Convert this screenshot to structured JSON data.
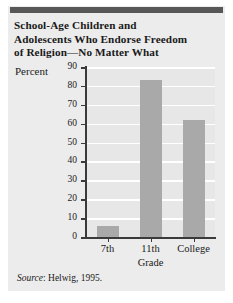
{
  "figure": {
    "title_lines": [
      "School-Age Children and",
      "Adolescents Who Endorse Freedom",
      "of Religion—No Matter What"
    ],
    "source_prefix": "Source",
    "source_separator": ": ",
    "source_text": "Helwig, 1995.",
    "colors": {
      "card_background": "#ececec",
      "top_rule": "#575757",
      "plot_background": "#e7e7e7",
      "bar_fill": "#a9a9a9",
      "gridline": "#ffffff",
      "axis": "#3a3a3a",
      "text": "#1a1a1a"
    }
  },
  "chart_data": {
    "type": "bar",
    "title": "School-Age Children and Adolescents Who Endorse Freedom of Religion—No Matter What",
    "categories": [
      "7th",
      "11th",
      "College"
    ],
    "values": [
      6,
      83,
      62
    ],
    "xlabel": "Grade",
    "ylabel": "Percent",
    "ylim": [
      0,
      90
    ],
    "ytick_labels": [
      "90",
      "80",
      "70",
      "60",
      "50",
      "40",
      "30",
      "20",
      "10",
      "0"
    ],
    "ytick_values": [
      90,
      80,
      70,
      60,
      50,
      40,
      30,
      20,
      10,
      0
    ],
    "grid": true,
    "legend": false,
    "source": "Source: Helwig, 1995."
  }
}
